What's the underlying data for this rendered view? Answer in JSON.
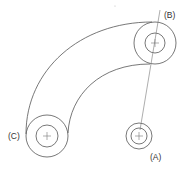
{
  "diagram": {
    "type": "mechanical-link-drawing",
    "colors": {
      "line": "#555555",
      "text": "#333333",
      "background": "#ffffff"
    },
    "points": {
      "A": {
        "label": "(A)",
        "cx": 139,
        "cy": 136,
        "outer_r": 13,
        "inner_r": 8
      },
      "B": {
        "label": "(B)",
        "cx": 155,
        "cy": 43,
        "outer_r": 21,
        "inner_r": 10
      },
      "C": {
        "label": "(C)",
        "cx": 47,
        "cy": 136,
        "outer_r": 21,
        "inner_r": 11
      }
    },
    "labels": {
      "a": "(A)",
      "b": "(B)",
      "c": "(C)"
    },
    "connector": {
      "from": "A",
      "to": "B",
      "style": "thin line extended beyond B"
    }
  }
}
